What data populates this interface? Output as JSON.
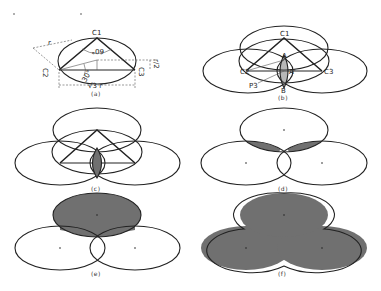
{
  "figure": {
    "panels": [
      {
        "id": "a",
        "caption": "(a)",
        "labels": {
          "c1": "C1",
          "c2": "C2",
          "c3": "C3",
          "r": "r",
          "angle60": "60°",
          "angle30": "30°",
          "half_r": "r/2",
          "base": "√3 r"
        }
      },
      {
        "id": "b",
        "caption": "(b)",
        "labels": {
          "c1": "C1",
          "c2": "C2",
          "c3": "C3",
          "a_top": "A",
          "a_mid": "A'",
          "b": "B",
          "p3": "P3"
        }
      },
      {
        "id": "c",
        "caption": "(c)"
      },
      {
        "id": "d",
        "caption": "(d)"
      },
      {
        "id": "e",
        "caption": "(e)"
      },
      {
        "id": "f",
        "caption": "(f)"
      }
    ],
    "colors": {
      "stroke": "#222222",
      "shade": "#707070",
      "background": "#ffffff"
    }
  }
}
